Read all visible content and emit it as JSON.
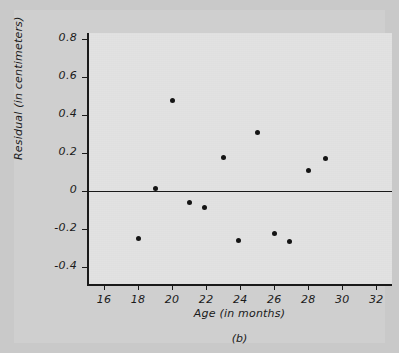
{
  "figure": {
    "caption": "(b)",
    "background_color": "#cfcfcf",
    "plot_background_color": "#e2e2e2",
    "axis_color": "#1a1a1a",
    "marker_color": "#141414"
  },
  "chart_data": {
    "type": "scatter",
    "title": "",
    "xlabel": "Age (in months)",
    "ylabel": "Residual (in centimeters)",
    "xlim": [
      15,
      32.8
    ],
    "ylim": [
      -0.49,
      0.83
    ],
    "xticks": [
      16,
      18,
      20,
      22,
      24,
      26,
      28,
      30,
      32
    ],
    "xtick_labels": [
      "16",
      "18",
      "20",
      "22",
      "24",
      "26",
      "28",
      "30",
      "32"
    ],
    "yticks": [
      0.8,
      0.6,
      0.4,
      0.2,
      0,
      -0.2,
      -0.4
    ],
    "ytick_labels": [
      "0.8",
      "0.6",
      "0.4",
      "0.2",
      "0",
      "-0.2",
      "-0.4"
    ],
    "grid": false,
    "legend": null,
    "reference_line": {
      "orientation": "horizontal",
      "y": 0,
      "color": "#1a1a1a"
    },
    "x": [
      17.9,
      18.9,
      19.9,
      20.9,
      21.8,
      22.9,
      23.8,
      24.9,
      25.9,
      26.8,
      27.9,
      28.9
    ],
    "y": [
      -0.25,
      0.01,
      0.475,
      -0.06,
      -0.09,
      0.175,
      -0.26,
      0.305,
      -0.225,
      -0.265,
      0.105,
      0.17
    ],
    "points": [
      {
        "x": 17.9,
        "y": -0.25
      },
      {
        "x": 18.9,
        "y": 0.01
      },
      {
        "x": 19.9,
        "y": 0.475
      },
      {
        "x": 20.9,
        "y": -0.06
      },
      {
        "x": 21.8,
        "y": -0.09
      },
      {
        "x": 22.9,
        "y": 0.175
      },
      {
        "x": 23.8,
        "y": -0.26
      },
      {
        "x": 24.9,
        "y": 0.305
      },
      {
        "x": 25.9,
        "y": -0.225
      },
      {
        "x": 26.8,
        "y": -0.265
      },
      {
        "x": 27.9,
        "y": 0.105
      },
      {
        "x": 28.9,
        "y": 0.17
      }
    ]
  }
}
